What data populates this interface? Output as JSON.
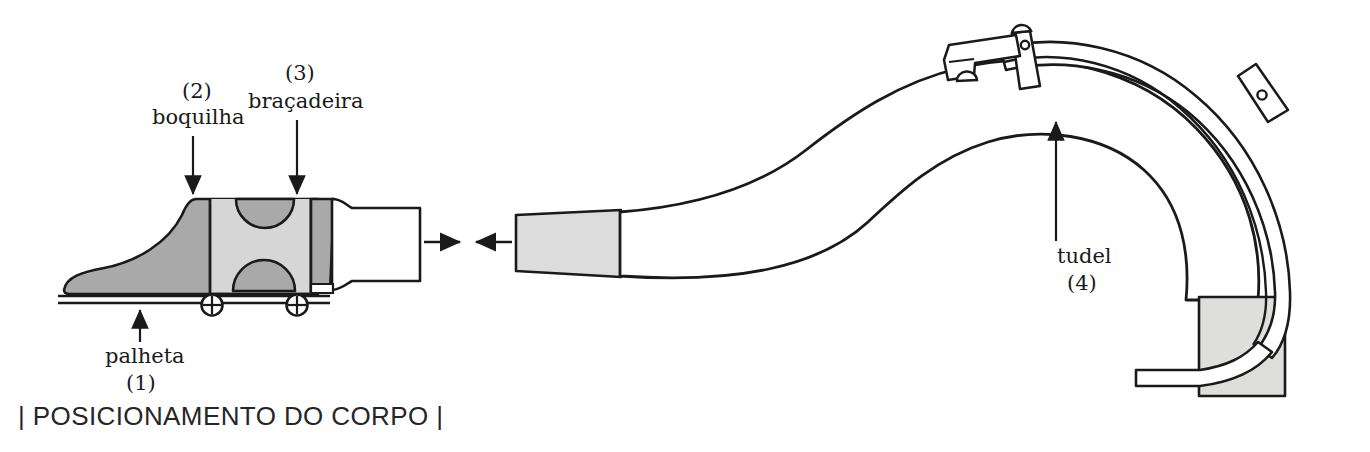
{
  "figure": {
    "title": "POSICIONAMENTO DO CORPO",
    "caption": "| POSICIONAMENTO DO CORPO |",
    "language": "pt",
    "background_color": "#ffffff",
    "ink_color": "#1a1a1a"
  },
  "parts": [
    {
      "number": "(1)",
      "label": "palheta",
      "english": "reed",
      "arrow": "up",
      "arrow_from": {
        "x": 140,
        "y": 340
      },
      "arrow_to": {
        "x": 140,
        "y": 300
      }
    },
    {
      "number": "(2)",
      "label": "boquilha",
      "english": "mouthpiece",
      "arrow": "down",
      "arrow_from": {
        "x": 193,
        "y": 138
      },
      "arrow_to": {
        "x": 193,
        "y": 196
      }
    },
    {
      "number": "(3)",
      "label": "braçadeira",
      "english": "ligature",
      "arrow": "down",
      "arrow_from": {
        "x": 297,
        "y": 122
      },
      "arrow_to": {
        "x": 297,
        "y": 196
      }
    },
    {
      "number": "(4)",
      "label": "tudel",
      "english": "bocal / crook",
      "arrow": "up",
      "arrow_from": {
        "x": 1056,
        "y": 243
      },
      "arrow_to": {
        "x": 1056,
        "y": 123
      }
    }
  ],
  "assembly_arrows": [
    {
      "name": "mouthpiece-insert-arrow",
      "direction": "right",
      "from": {
        "x": 425,
        "y": 242
      },
      "to": {
        "x": 462,
        "y": 242
      }
    },
    {
      "name": "bocal-insert-arrow",
      "direction": "left",
      "from": {
        "x": 510,
        "y": 242
      },
      "to": {
        "x": 473,
        "y": 242
      }
    }
  ],
  "colors": {
    "outline": "#1a1a1a",
    "mouthpiece_body_grey": "#a9a9a9",
    "ligature_grey": "#d6d6d6",
    "tenon_grey": "#dcdcdc",
    "cork_grey": "#dededc",
    "white": "#ffffff"
  },
  "components": {
    "mouthpiece": {
      "name": "boquilha",
      "fill": "#a9a9a9"
    },
    "reed": {
      "name": "palheta",
      "fill": "#ffffff"
    },
    "ligature": {
      "name": "braçadeira",
      "fill": "#d6d6d6",
      "screws": 2
    },
    "shank": {
      "name": "mouthpiece-shank",
      "fill": "#ffffff"
    },
    "bocal": {
      "name": "tudel",
      "fill": "#ffffff",
      "pivot_posts": 2,
      "key_levers": 1
    },
    "bocal_tenon": {
      "name": "bocal-tenon",
      "fill": "#dcdcdc"
    },
    "bocal_cork": {
      "name": "bocal-cork-socket",
      "fill": "#dededc"
    }
  }
}
